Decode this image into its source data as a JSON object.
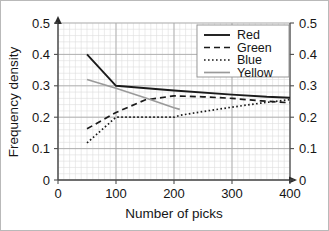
{
  "chart_data": {
    "type": "line",
    "title": "",
    "xlabel": "Number of picks",
    "ylabel": "Frequency density",
    "xlim": [
      0,
      400
    ],
    "ylim": [
      0,
      0.5
    ],
    "xticks": [
      "0",
      "100",
      "200",
      "300",
      "400"
    ],
    "xtick_values": [
      0,
      100,
      200,
      300,
      400
    ],
    "yticks": [
      "0",
      "0.1",
      "0.2",
      "0.3",
      "0.4",
      "0.5"
    ],
    "ytick_values": [
      0,
      0.1,
      0.2,
      0.3,
      0.4,
      0.5
    ],
    "yticks_right": [
      "0",
      "0.1",
      "0.2",
      "0.3",
      "0.4",
      "0.5"
    ],
    "grid": "major and minor",
    "minor_x_step": 10,
    "minor_y_step": 0.02,
    "legend_position": "top-right",
    "series": [
      {
        "name": "Red",
        "style": "solid",
        "color": "#1a1a1a",
        "width": 1.9,
        "x": [
          50,
          100,
          200,
          300,
          360,
          400
        ],
        "values": [
          0.4,
          0.3,
          0.285,
          0.272,
          0.265,
          0.262
        ]
      },
      {
        "name": "Green",
        "style": "dashed",
        "color": "#1a1a1a",
        "width": 1.7,
        "x": [
          50,
          100,
          150,
          200,
          250,
          300,
          350,
          400
        ],
        "values": [
          0.163,
          0.215,
          0.255,
          0.268,
          0.265,
          0.26,
          0.252,
          0.246
        ]
      },
      {
        "name": "Blue",
        "style": "dotted",
        "color": "#1a1a1a",
        "width": 1.7,
        "x": [
          50,
          100,
          150,
          200,
          210,
          250,
          300,
          350,
          400
        ],
        "values": [
          0.118,
          0.2,
          0.2,
          0.2,
          0.206,
          0.218,
          0.232,
          0.245,
          0.256
        ]
      },
      {
        "name": "Yellow",
        "style": "solid",
        "color": "#9a9a9a",
        "width": 1.7,
        "x": [
          50,
          100,
          150,
          200,
          210
        ],
        "values": [
          0.32,
          0.292,
          0.262,
          0.23,
          0.225
        ]
      }
    ]
  },
  "axes": {
    "y_title": "Frequency density",
    "x_title": "Number of picks",
    "y_labels_left": [
      "0.5",
      "0.4",
      "0.3",
      "0.2",
      "0.1",
      "0"
    ],
    "y_labels_right": [
      "0.5",
      "0.4",
      "0.3",
      "0.2",
      "0.1",
      "0"
    ],
    "x_labels": [
      "0",
      "100",
      "200",
      "300",
      "400"
    ]
  },
  "legend": {
    "entries": [
      {
        "label": "Red"
      },
      {
        "label": "Green"
      },
      {
        "label": "Blue"
      },
      {
        "label": "Yellow"
      }
    ]
  }
}
